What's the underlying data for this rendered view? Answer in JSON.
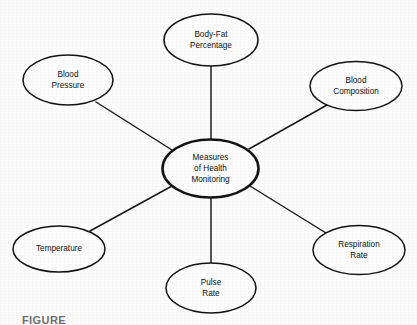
{
  "figure": {
    "caption_partial": "FIGURE",
    "background_color": "#fcfcfc",
    "stroke_color": "#131416",
    "node_fill_color": "#fdfdfd",
    "text_color": "#111111"
  },
  "center_node": {
    "id": "measures-of-health-monitoring",
    "lines": [
      "Measures",
      "of Health",
      "Monitoring"
    ],
    "cx": 210.5,
    "cy": 168.5,
    "rx": 48,
    "ry": 29
  },
  "nodes": [
    {
      "id": "body-fat-percentage",
      "lines": [
        "Body-Fat",
        "Percentage"
      ],
      "cx": 211,
      "cy": 40,
      "rx": 47,
      "ry": 26
    },
    {
      "id": "blood-composition",
      "lines": [
        "Blood",
        "Composition"
      ],
      "cx": 356,
      "cy": 86,
      "rx": 46,
      "ry": 24.5
    },
    {
      "id": "respiration-rate",
      "lines": [
        "Respiration",
        "Rate"
      ],
      "cx": 359,
      "cy": 250,
      "rx": 46,
      "ry": 24.5
    },
    {
      "id": "pulse-rate",
      "lines": [
        "Pulse",
        "Rate"
      ],
      "cx": 211,
      "cy": 288,
      "rx": 45,
      "ry": 25
    },
    {
      "id": "temperature",
      "lines": [
        "Temperature"
      ],
      "cx": 59,
      "cy": 249,
      "rx": 46,
      "ry": 23
    },
    {
      "id": "blood-pressure",
      "lines": [
        "Blood",
        "Pressure"
      ],
      "cx": 68,
      "cy": 80,
      "rx": 45,
      "ry": 25
    }
  ],
  "edges": [
    {
      "id": "edge-body-fat-percentage",
      "from": "measures-of-health-monitoring",
      "to": "body-fat-percentage",
      "x1": 211,
      "y1": 139.5,
      "x2": 211,
      "y2": 66
    },
    {
      "id": "edge-blood-composition",
      "from": "measures-of-health-monitoring",
      "to": "blood-composition",
      "x1": 249,
      "y1": 149,
      "x2": 327,
      "y2": 105
    },
    {
      "id": "edge-respiration-rate",
      "from": "measures-of-health-monitoring",
      "to": "respiration-rate",
      "x1": 250,
      "y1": 186,
      "x2": 326,
      "y2": 233
    },
    {
      "id": "edge-pulse-rate",
      "from": "measures-of-health-monitoring",
      "to": "pulse-rate",
      "x1": 211,
      "y1": 197.5,
      "x2": 211,
      "y2": 263
    },
    {
      "id": "edge-temperature",
      "from": "measures-of-health-monitoring",
      "to": "temperature",
      "x1": 172,
      "y1": 186,
      "x2": 90,
      "y2": 231
    },
    {
      "id": "edge-blood-pressure",
      "from": "measures-of-health-monitoring",
      "to": "blood-pressure",
      "x1": 172,
      "y1": 150,
      "x2": 96,
      "y2": 102
    }
  ]
}
